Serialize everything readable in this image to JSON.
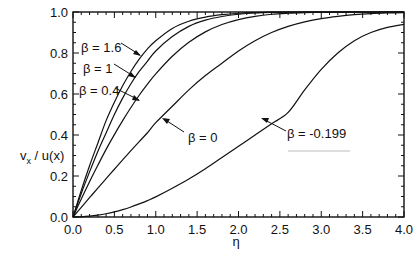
{
  "chart_data": {
    "type": "line",
    "title": "",
    "xlabel": "η",
    "ylabel": "v_x / u(x)",
    "xlim": [
      0.0,
      4.0
    ],
    "ylim": [
      0.0,
      1.0
    ],
    "grid": false,
    "legend": "annotations with arrows",
    "x_ticks": [
      "0.0",
      "0.5",
      "1.0",
      "1.5",
      "2.0",
      "2.5",
      "3.0",
      "3.5",
      "4.0"
    ],
    "y_ticks": [
      "0.0",
      "0.2",
      "0.4",
      "0.6",
      "0.8",
      "1.0"
    ],
    "x": [
      0.0,
      0.1,
      0.2,
      0.3,
      0.4,
      0.5,
      0.6,
      0.7,
      0.8,
      0.9,
      1.0,
      1.2,
      1.4,
      1.6,
      1.8,
      2.0,
      2.2,
      2.4,
      2.6,
      2.8,
      3.0,
      3.2,
      3.4,
      3.6,
      3.8,
      4.0
    ],
    "series": [
      {
        "name": "β = 1.6",
        "values": [
          0.0,
          0.13,
          0.25,
          0.36,
          0.47,
          0.56,
          0.64,
          0.71,
          0.77,
          0.82,
          0.86,
          0.92,
          0.955,
          0.975,
          0.987,
          0.994,
          0.997,
          0.999,
          1.0,
          1.0,
          1.0,
          1.0,
          1.0,
          1.0,
          1.0,
          1.0
        ]
      },
      {
        "name": "β = 1",
        "values": [
          0.0,
          0.115,
          0.22,
          0.32,
          0.41,
          0.5,
          0.58,
          0.65,
          0.71,
          0.76,
          0.81,
          0.88,
          0.93,
          0.96,
          0.978,
          0.989,
          0.995,
          0.998,
          0.999,
          1.0,
          1.0,
          1.0,
          1.0,
          1.0,
          1.0,
          1.0
        ]
      },
      {
        "name": "β = 0.4",
        "values": [
          0.0,
          0.088,
          0.172,
          0.252,
          0.33,
          0.402,
          0.47,
          0.534,
          0.594,
          0.648,
          0.698,
          0.784,
          0.852,
          0.903,
          0.939,
          0.963,
          0.979,
          0.989,
          0.994,
          0.997,
          0.999,
          1.0,
          1.0,
          1.0,
          1.0,
          1.0
        ]
      },
      {
        "name": "β = 0",
        "values": [
          0.0,
          0.047,
          0.094,
          0.141,
          0.187,
          0.233,
          0.279,
          0.324,
          0.368,
          0.411,
          0.46,
          0.54,
          0.62,
          0.69,
          0.75,
          0.81,
          0.86,
          0.9,
          0.93,
          0.952,
          0.968,
          0.979,
          0.987,
          0.992,
          0.995,
          0.997
        ]
      },
      {
        "name": "β = -0.199",
        "values": [
          0.0,
          0.001,
          0.004,
          0.009,
          0.016,
          0.025,
          0.036,
          0.049,
          0.064,
          0.08,
          0.098,
          0.14,
          0.185,
          0.235,
          0.29,
          0.345,
          0.4,
          0.455,
          0.51,
          0.62,
          0.72,
          0.8,
          0.86,
          0.9,
          0.925,
          0.94
        ]
      }
    ],
    "annotations": [
      {
        "text": "β = 1.6",
        "target_series": "β = 1.6"
      },
      {
        "text": "β = 1",
        "target_series": "β = 1"
      },
      {
        "text": "β = 0.4",
        "target_series": "β = 0.4"
      },
      {
        "text": "β = 0",
        "target_series": "β = 0"
      },
      {
        "text": "β = -0.199",
        "target_series": "β = -0.199"
      }
    ]
  },
  "labels": {
    "xlabel": "η",
    "ylabel_main": "v",
    "ylabel_sub": "x",
    "ylabel_rest": " / u(x)",
    "beta_1_6": "β = 1.6",
    "beta_1": "β = 1",
    "beta_0_4": "β = 0.4",
    "beta_0": "β = 0",
    "beta_neg": "β = -0.199"
  }
}
